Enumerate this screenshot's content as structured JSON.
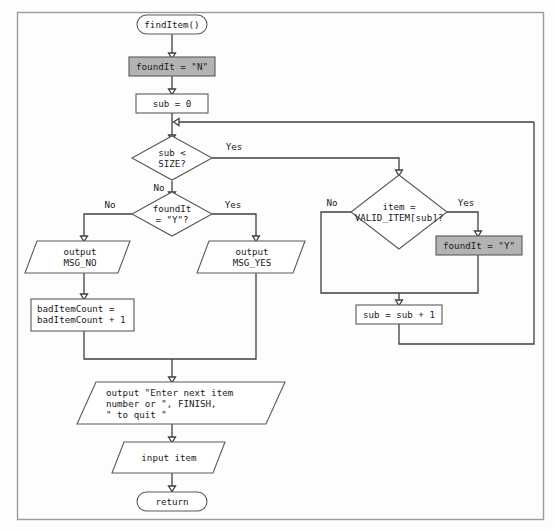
{
  "diagram": {
    "colors": {
      "shaded_fill": "#b3b3b3",
      "node_fill": "#ffffff",
      "node_stroke": "#5a5a5a",
      "connector_stroke": "#3f3f3f",
      "frame_stroke": "#9b9b9b",
      "background": "#fdfdfd"
    },
    "nodes": {
      "start": {
        "label": "findItem()",
        "shape": "terminator"
      },
      "init_found": {
        "label": "foundIt = \"N\"",
        "shape": "process",
        "shaded": true
      },
      "init_sub": {
        "label": "sub = 0",
        "shape": "process",
        "shaded": false
      },
      "loop_test": {
        "line1": "sub <",
        "line2": "SIZE?",
        "shape": "decision"
      },
      "found_test": {
        "line1": "foundIt",
        "line2": "= \"Y\"?",
        "shape": "decision"
      },
      "valid_test": {
        "line1": "item =",
        "line2": "VALID_ITEM[sub]?",
        "shape": "decision"
      },
      "set_found_y": {
        "label": "foundIt = \"Y\"",
        "shape": "process",
        "shaded": true
      },
      "incr_sub": {
        "label": "sub = sub + 1",
        "shape": "process",
        "shaded": false
      },
      "out_no": {
        "line1": "output",
        "line2": "MSG_NO",
        "shape": "io"
      },
      "out_yes": {
        "line1": "output",
        "line2": "MSG_YES",
        "shape": "io"
      },
      "bad_count": {
        "line1": "badItemCount =",
        "line2": "badItemCount + 1",
        "shape": "process",
        "shaded": false
      },
      "prompt": {
        "line1": "output \"Enter next item",
        "line2": "number or \", FINISH,",
        "line3": "\" to quit \"",
        "shape": "io"
      },
      "input_item": {
        "label": "input item",
        "shape": "io"
      },
      "end": {
        "label": "return",
        "shape": "terminator"
      }
    },
    "edge_labels": {
      "loop_yes": "Yes",
      "loop_no": "No",
      "found_no": "No",
      "found_yes": "Yes",
      "valid_no": "No",
      "valid_yes": "Yes"
    }
  }
}
